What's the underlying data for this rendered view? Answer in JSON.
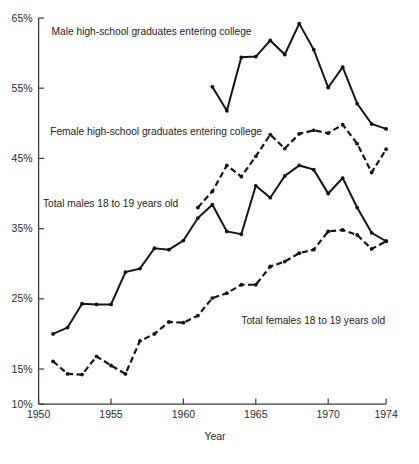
{
  "chart_data": {
    "type": "line",
    "title": "",
    "xlabel": "Year",
    "ylabel": "",
    "xlim": [
      1950,
      1974
    ],
    "ylim": [
      10,
      65
    ],
    "grid": false,
    "legend_position": "inline-annotations",
    "x_ticks": [
      1950,
      1955,
      1960,
      1965,
      1970,
      1974
    ],
    "x_tick_labels": [
      "1950",
      "1955",
      "1960",
      "1965",
      "1970",
      "1974"
    ],
    "y_ticks": [
      10,
      15,
      25,
      35,
      45,
      55,
      65
    ],
    "y_tick_labels": [
      "10%",
      "15%",
      "25%",
      "35%",
      "45%",
      "55%",
      "65%"
    ],
    "series": [
      {
        "name": "Male high-school graduates entering college",
        "style": "solid",
        "x": [
          1962,
          1963,
          1964,
          1965,
          1966,
          1967,
          1968,
          1969,
          1970,
          1971,
          1972,
          1973,
          1974
        ],
        "values": [
          55.2,
          51.8,
          59.4,
          59.5,
          61.8,
          59.8,
          64.2,
          60.5,
          55.1,
          58.0,
          52.8,
          49.9,
          49.2
        ]
      },
      {
        "name": "Female high-school graduates entering college",
        "style": "dashed",
        "x": [
          1961,
          1962,
          1963,
          1964,
          1965,
          1966,
          1967,
          1968,
          1969,
          1970,
          1971,
          1972,
          1973,
          1974
        ],
        "values": [
          38.0,
          40.3,
          44.0,
          42.4,
          45.3,
          48.4,
          46.4,
          48.5,
          49.0,
          48.6,
          49.8,
          47.1,
          43.0,
          46.3
        ]
      },
      {
        "name": "Total males 18 to 19 years old",
        "style": "solid",
        "x": [
          1951,
          1952,
          1953,
          1954,
          1955,
          1956,
          1957,
          1958,
          1959,
          1960,
          1961,
          1962,
          1963,
          1964,
          1965,
          1966,
          1967,
          1968,
          1969,
          1970,
          1971,
          1972,
          1973,
          1974
        ],
        "values": [
          20.0,
          20.9,
          24.3,
          24.2,
          24.2,
          28.8,
          29.3,
          32.2,
          32.0,
          33.3,
          36.5,
          38.4,
          34.6,
          34.2,
          41.1,
          39.4,
          42.5,
          44.0,
          43.4,
          40.0,
          42.2,
          38.0,
          34.4,
          33.2
        ]
      },
      {
        "name": "Total females 18 to 19 years old",
        "style": "dashed",
        "x": [
          1951,
          1952,
          1953,
          1954,
          1955,
          1956,
          1957,
          1958,
          1959,
          1960,
          1961,
          1962,
          1963,
          1964,
          1965,
          1966,
          1967,
          1968,
          1969,
          1970,
          1971,
          1972,
          1973,
          1974
        ],
        "values": [
          16.1,
          14.3,
          14.2,
          16.8,
          15.5,
          14.3,
          19.0,
          20.0,
          21.7,
          21.6,
          22.6,
          25.1,
          25.8,
          27.0,
          27.0,
          29.6,
          30.3,
          31.5,
          32.0,
          34.6,
          34.8,
          34.1,
          32.1,
          33.2
        ]
      }
    ],
    "annotations": [
      {
        "text": "Male high-school graduates entering college",
        "x": 1950.9,
        "y": 62.6
      },
      {
        "text": "Female high-school graduates entering college",
        "x": 1950.8,
        "y": 48.4
      },
      {
        "text": "Total males 18   to 19   years old",
        "x": 1950.3,
        "y": 38.1
      },
      {
        "text": "Total females 18   to 19   years old",
        "x": 1964.0,
        "y": 21.4
      }
    ]
  }
}
